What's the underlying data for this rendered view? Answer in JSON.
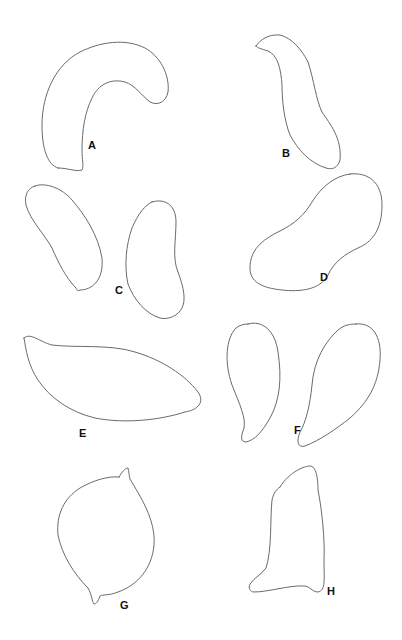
{
  "figure": {
    "type": "specimen outline drawings",
    "labels": [
      "A",
      "B",
      "C",
      "D",
      "E",
      "F",
      "G",
      "H"
    ],
    "panels": [
      {
        "id": "A",
        "label": "A",
        "description": "curved C-shaped outline"
      },
      {
        "id": "B",
        "label": "B",
        "description": "elongated S-curved outline with small tip"
      },
      {
        "id": "C",
        "label": "C",
        "description": "pair of kidney-shaped outlines with small nubs"
      },
      {
        "id": "D",
        "label": "D",
        "description": "elongated peanut-shaped outline, diagonal"
      },
      {
        "id": "E",
        "label": "E",
        "description": "elongated lens/almond-shaped outline"
      },
      {
        "id": "F",
        "label": "F",
        "description": "pair of teardrop outlines with hooked tips"
      },
      {
        "id": "G",
        "label": "G",
        "description": "rounded lemon-shaped outline with spur at top and nub at bottom"
      },
      {
        "id": "H",
        "label": "H",
        "description": "tall trapezoidal outline"
      }
    ]
  },
  "colors": {
    "stroke": "#6a6a6a",
    "label": "#111111",
    "background": "#ffffff"
  }
}
